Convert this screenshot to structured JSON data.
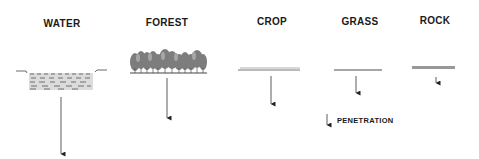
{
  "diagram": {
    "columns": [
      {
        "id": "water",
        "label": "WATER",
        "penetration_relative": "deepest"
      },
      {
        "id": "forest",
        "label": "FOREST",
        "penetration_relative": "deep"
      },
      {
        "id": "crop",
        "label": "CROP",
        "penetration_relative": "moderate"
      },
      {
        "id": "grass",
        "label": "GRASS",
        "penetration_relative": "shallow"
      },
      {
        "id": "rock",
        "label": "ROCK",
        "penetration_relative": "shallowest"
      }
    ],
    "legend": {
      "icon": "down-arrow-icon",
      "label": "PENETRATION"
    },
    "colors": {
      "text": "#1a1a1a",
      "surface_gray": "#8a8a8a",
      "tree_gray": "#7a7a7a",
      "arrow": "#333333",
      "water_dash": "#6e6e6e"
    }
  }
}
